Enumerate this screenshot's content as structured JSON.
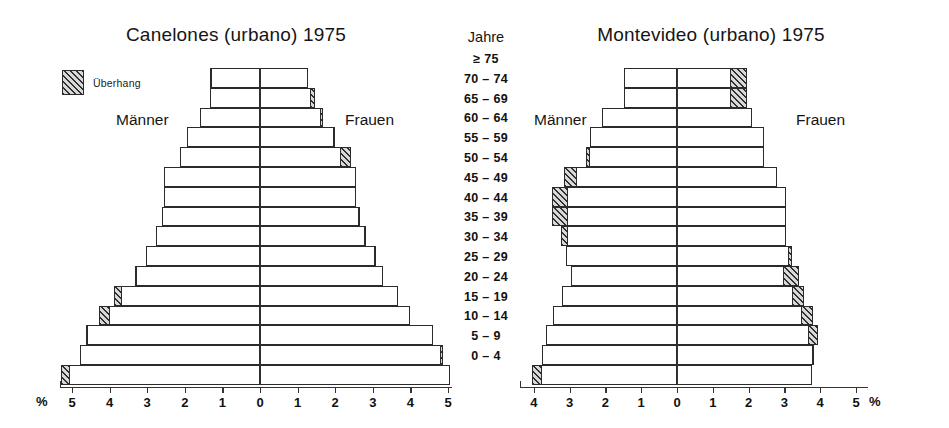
{
  "figure": {
    "legend": {
      "label": "Überhang",
      "swatch_name": "hatched-overhang-swatch"
    },
    "axis_unit": "%",
    "age_header": "Jahre",
    "male_label": "Männer",
    "female_label": "Frauen",
    "line_color": "#2b2b2b",
    "hatch_color": "#2f2f2f",
    "bar_fill": "#ffffff"
  },
  "age_groups": [
    "≥ 75",
    "70 – 74",
    "65 – 69",
    "60 – 64",
    "55 – 59",
    "50 – 54",
    "45 – 49",
    "40 – 44",
    "35 – 39",
    "30 – 34",
    "25 – 29",
    "20 – 24",
    "15 – 19",
    "10 – 14",
    "5 – 9",
    "0 – 4"
  ],
  "chart_data": [
    {
      "id": "canelones",
      "type": "bar",
      "orientation": "population-pyramid",
      "title": "Canelones (urbano) 1975",
      "xlabel": "%",
      "ylabel": "Jahre",
      "xlim": [
        -5.2,
        5.2
      ],
      "xticks_left": [
        5,
        4,
        3,
        2,
        1
      ],
      "xticks_center": 0,
      "xticks_right": [
        1,
        2,
        3,
        4,
        5
      ],
      "grid": false,
      "legend_position": "top-left",
      "categories": [
        "≥ 75",
        "70 – 74",
        "65 – 69",
        "60 – 64",
        "55 – 59",
        "50 – 54",
        "45 – 49",
        "40 – 44",
        "35 – 39",
        "30 – 34",
        "25 – 29",
        "20 – 24",
        "15 – 19",
        "10 – 14",
        "5 – 9",
        "0 – 4"
      ],
      "series": [
        {
          "name": "Männer",
          "side": "left",
          "values": [
            1.33,
            1.33,
            1.6,
            1.93,
            2.14,
            2.54,
            2.54,
            2.6,
            2.77,
            3.03,
            3.33,
            3.87,
            4.27,
            4.62,
            4.8,
            5.3
          ]
        },
        {
          "name": "Frauen",
          "side": "right",
          "values": [
            1.27,
            1.45,
            1.67,
            2.0,
            2.41,
            2.54,
            2.54,
            2.67,
            2.83,
            3.07,
            3.27,
            3.67,
            4.0,
            4.6,
            4.87,
            5.05
          ]
        }
      ],
      "overhang": [
        {
          "side": "right",
          "from": 1.27,
          "to": 1.65
        },
        {
          "side": "right",
          "from": 1.45,
          "to": 1.6
        },
        {
          "side": "right",
          "from": 1.67,
          "to": 1.8
        },
        {
          "side": "right",
          "from": 2.0,
          "to": 2.16
        },
        {
          "side": "left",
          "from": 2.54,
          "to": 2.68
        },
        {
          "side": "right",
          "from": 3.07,
          "to": 3.24
        },
        {
          "side": "right",
          "from": 3.27,
          "to": 3.43
        },
        {
          "side": "right",
          "from": 3.67,
          "to": 3.8
        },
        {
          "side": "left",
          "from": 4.27,
          "to": 4.44
        },
        {
          "side": "right",
          "from": 4.6,
          "to": 4.7
        },
        {
          "side": "left",
          "from": 4.8,
          "to": 4.9
        },
        {
          "side": "left",
          "from": 5.3,
          "to": 5.48
        }
      ]
    },
    {
      "id": "montevideo",
      "type": "bar",
      "orientation": "population-pyramid",
      "title": "Montevideo (urbano) 1975",
      "xlabel": "%",
      "ylabel": "Jahre",
      "xlim": [
        -4.4,
        5.2
      ],
      "xticks_left": [
        4,
        3,
        2,
        1
      ],
      "xticks_center": 0,
      "xticks_right": [
        1,
        2,
        3,
        4,
        5
      ],
      "grid": false,
      "legend_position": "none",
      "categories": [
        "≥ 75",
        "70 – 74",
        "65 – 69",
        "60 – 64",
        "55 – 59",
        "50 – 54",
        "45 – 49",
        "40 – 44",
        "35 – 39",
        "30 – 34",
        "25 – 29",
        "20 – 24",
        "15 – 19",
        "10 – 14",
        "5 – 9",
        "0 – 4"
      ],
      "series": [
        {
          "name": "Männer",
          "side": "left",
          "values": [
            1.47,
            1.47,
            2.1,
            2.42,
            2.55,
            3.15,
            3.5,
            3.5,
            3.25,
            3.1,
            2.95,
            3.2,
            3.45,
            3.65,
            3.78,
            4.05
          ]
        },
        {
          "name": "Frauen",
          "side": "right",
          "values": [
            1.95,
            1.95,
            2.1,
            2.42,
            2.42,
            2.8,
            3.05,
            3.05,
            3.05,
            3.2,
            3.4,
            3.55,
            3.8,
            3.95,
            3.8,
            3.78
          ]
        }
      ],
      "overhang": [
        {
          "side": "right",
          "from": 1.95,
          "to": 3.35
        },
        {
          "side": "right",
          "from": 1.95,
          "to": 2.5
        },
        {
          "side": "right",
          "from": 2.1,
          "to": 2.72
        },
        {
          "side": "right",
          "from": 2.42,
          "to": 3.05
        },
        {
          "side": "right",
          "from": 2.42,
          "to": 3.05
        },
        {
          "side": "right",
          "from": 2.8,
          "to": 3.38
        },
        {
          "side": "right",
          "from": 3.05,
          "to": 3.8
        },
        {
          "side": "right",
          "from": 3.05,
          "to": 3.8
        },
        {
          "side": "right",
          "from": 3.05,
          "to": 3.62
        },
        {
          "side": "right",
          "from": 3.2,
          "to": 3.72
        },
        {
          "side": "right",
          "from": 3.4,
          "to": 3.8
        },
        {
          "side": "right",
          "from": 3.55,
          "to": 3.98
        },
        {
          "side": "right",
          "from": 3.8,
          "to": 4.2
        },
        {
          "side": "left",
          "from": 3.65,
          "to": 3.78
        },
        {
          "side": "left",
          "from": 3.78,
          "to": 3.88
        },
        {
          "side": "left",
          "from": 4.05,
          "to": 4.22
        }
      ]
    }
  ]
}
